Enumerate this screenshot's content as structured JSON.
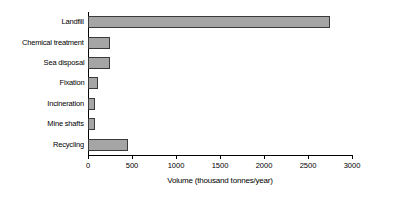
{
  "chart_data": {
    "type": "bar",
    "orientation": "horizontal",
    "title": "",
    "xlabel": "Volume (thousand tonnes/year)",
    "ylabel": "",
    "xlim": [
      0,
      3000
    ],
    "xticks": [
      0,
      500,
      1000,
      1500,
      2000,
      2500,
      3000
    ],
    "xtick_labels": [
      "0",
      "500",
      "1000",
      "1500",
      "2000",
      "2500",
      "3000"
    ],
    "grid": false,
    "legend": false,
    "categories": [
      "Landfill",
      "Chemical treatment",
      "Sea disposal",
      "Fixation",
      "Incineration",
      "Mine shafts",
      "Recycling"
    ],
    "values": [
      2750,
      250,
      250,
      110,
      80,
      80,
      450
    ],
    "bar_fill_color": "#a5a5a5",
    "bar_edge_color": "#3a3a3a",
    "axis_color": "#000000",
    "background_color": "#ffffff"
  }
}
